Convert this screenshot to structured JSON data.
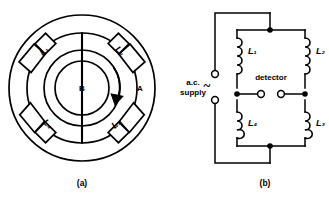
{
  "figure": {
    "panels": [
      {
        "id": "panel-a",
        "caption": "(a)",
        "type": "rotating-field-coil-arrangement",
        "labels": {
          "coil_1": "L₁",
          "coil_2": "L₂",
          "coil_3": "L₃",
          "coil_4": "L₄",
          "outer_region": "A",
          "inner_region": "B"
        },
        "rotation_arrow": "clockwise-rotation-arrow"
      },
      {
        "id": "panel-b",
        "caption": "(b)",
        "type": "ac-inductance-bridge-circuit",
        "labels": {
          "inductor_1": "L₁",
          "inductor_2": "L₂",
          "inductor_3": "L₃",
          "inductor_4": "L₄",
          "detector": "detector",
          "supply_line_1": "a.c.",
          "supply_line_2": "supply",
          "supply_symbol": "~"
        }
      }
    ]
  },
  "colors": {
    "stroke": "#000000",
    "background": "#ffffff"
  }
}
